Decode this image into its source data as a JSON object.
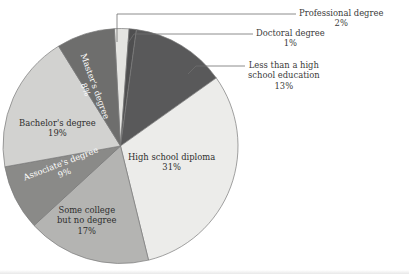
{
  "chart_data": {
    "type": "pie",
    "title": "",
    "subtitle": "",
    "xlabel": "",
    "ylabel": "",
    "legend_position": "none",
    "grid": false,
    "units": "percent",
    "total": 100,
    "categories": [
      "Professional degree",
      "Doctoral degree",
      "Less than a high school education",
      "High school diploma",
      "Some college but no degree",
      "Associate's degree",
      "Bachelor's degree",
      "Master's degree"
    ],
    "values": [
      2,
      1,
      13,
      31,
      17,
      9,
      19,
      8
    ],
    "slices": [
      {
        "name": "Professional degree",
        "label_line1": "Professional degree",
        "label_line2": "",
        "value": 2,
        "value_label": "2%",
        "color": "#e4e4e1",
        "label_placement": "callout",
        "text_color": "#3b3b3b"
      },
      {
        "name": "Doctoral degree",
        "label_line1": "Doctoral degree",
        "label_line2": "",
        "value": 1,
        "value_label": "1%",
        "color": "#4f4f50",
        "label_placement": "callout",
        "text_color": "#3b3b3b"
      },
      {
        "name": "Less than a high school education",
        "label_line1": "Less than a high",
        "label_line2": "school education",
        "value": 13,
        "value_label": "13%",
        "color": "#59595a",
        "label_placement": "callout",
        "text_color": "#3b3b3b"
      },
      {
        "name": "High school diploma",
        "label_line1": "High school diploma",
        "label_line2": "",
        "value": 31,
        "value_label": "31%",
        "color": "#ececea",
        "label_placement": "inside",
        "text_color": "#2e2e2e"
      },
      {
        "name": "Some college but no degree",
        "label_line1": "Some college",
        "label_line2": "but no degree",
        "value": 17,
        "value_label": "17%",
        "color": "#b4b4b2",
        "label_placement": "inside",
        "text_color": "#2e2e2e"
      },
      {
        "name": "Associate's degree",
        "label_line1": "Associate's degree",
        "label_line2": "",
        "value": 9,
        "value_label": "9%",
        "color": "#8a8a88",
        "label_placement": "inside-rotated",
        "text_color": "#ffffff"
      },
      {
        "name": "Bachelor's degree",
        "label_line1": "Bachelor's degree",
        "label_line2": "",
        "value": 19,
        "value_label": "19%",
        "color": "#d2d2d0",
        "label_placement": "inside",
        "text_color": "#2e2e2e"
      },
      {
        "name": "Master's degree",
        "label_line1": "Master's degree",
        "label_line2": "",
        "value": 8,
        "value_label": "8%",
        "color": "#6e6e6d",
        "label_placement": "inside-rotated",
        "text_color": "#ffffff"
      }
    ],
    "style": {
      "background": "#ffffff",
      "outline_color": "#7a7a7a",
      "leader_line_color": "#6f6f6f"
    }
  }
}
